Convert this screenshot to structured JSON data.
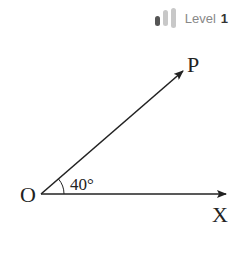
{
  "badge": {
    "label": "Level",
    "number": "1",
    "bars_filled": 1,
    "bars_total": 3
  },
  "diagram": {
    "vertex_label": "O",
    "ray1_label": "X",
    "ray2_label": "P",
    "angle_label": "40°",
    "angle_degrees": 40
  }
}
